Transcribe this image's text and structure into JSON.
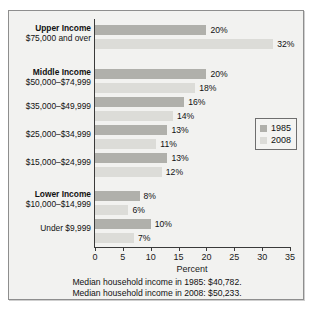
{
  "chart_data": {
    "type": "bar",
    "orientation": "horizontal",
    "title": "",
    "xlabel": "Percent",
    "ylabel": "",
    "xlim": [
      0,
      35
    ],
    "xticks": [
      0,
      5,
      10,
      15,
      20,
      25,
      30,
      35
    ],
    "grid": false,
    "legend_position": "right-middle",
    "categories": [
      {
        "bold": "Upper Income",
        "sub": "$75,000 and over"
      },
      {
        "bold": "Middle Income",
        "sub": "$50,000–$74,999"
      },
      {
        "bold": "",
        "sub": "$35,000–$49,999"
      },
      {
        "bold": "",
        "sub": "$25,000–$34,999"
      },
      {
        "bold": "",
        "sub": "$15,000–$24,999"
      },
      {
        "bold": "Lower Income",
        "sub": "$10,000–$14,999"
      },
      {
        "bold": "",
        "sub": "Under $9,999"
      }
    ],
    "series": [
      {
        "name": "1985",
        "color": "#b0b0ab",
        "values": [
          20,
          20,
          16,
          13,
          13,
          8,
          10
        ],
        "labels": [
          "20%",
          "20%",
          "16%",
          "13%",
          "13%",
          "8%",
          "10%"
        ]
      },
      {
        "name": "2008",
        "color": "#dcdcd8",
        "values": [
          32,
          18,
          14,
          11,
          12,
          6,
          7
        ],
        "labels": [
          "32%",
          "18%",
          "14%",
          "11%",
          "12%",
          "6%",
          "7%"
        ]
      }
    ],
    "notes": [
      "Median household income in 1985: $40,782.",
      "Median household income in 2008: $50,233."
    ]
  },
  "legend": {
    "items": [
      {
        "label": "1985"
      },
      {
        "label": "2008"
      }
    ]
  },
  "axis": {
    "tick_labels": [
      "0",
      "5",
      "10",
      "15",
      "20",
      "25",
      "30",
      "35"
    ],
    "x_title": "Percent"
  },
  "colors": {
    "series_1985": "#b0b0ab",
    "series_2008": "#dcdcd8",
    "panel_background": "#f2f2f0",
    "border": "#8e8e8e",
    "text": "#111111"
  }
}
